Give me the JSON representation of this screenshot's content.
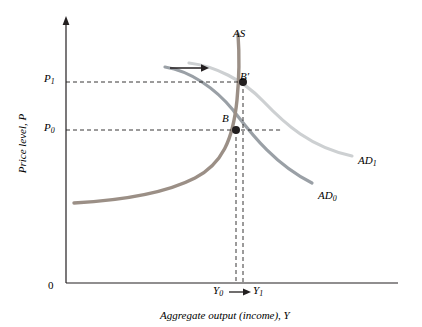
{
  "figure": {
    "axes": {
      "y_label": "Price level, P",
      "x_label": "Aggregate output (income), Y",
      "origin_label": "0"
    },
    "tick_labels": {
      "p1": "P",
      "p1_sub": "1",
      "p0": "P",
      "p0_sub": "0",
      "y0": "Y",
      "y0_sub": "0",
      "y1": "Y",
      "y1_sub": "1"
    },
    "curves": [
      {
        "name": "as-curve",
        "label": "AS",
        "label_sub": "",
        "color": "#231f20",
        "description": "Aggregate supply curve, steep J shape"
      },
      {
        "name": "ad0-curve",
        "label": "AD",
        "label_sub": "0",
        "color": "#9aa0a6",
        "description": "Initial aggregate demand curve, downward sloping"
      },
      {
        "name": "ad1-curve",
        "label": "AD",
        "label_sub": "1",
        "color": "#c9cbcd",
        "description": "Shifted aggregate demand curve, downward sloping"
      }
    ],
    "points": [
      {
        "name": "point-b",
        "label": "B",
        "color": "#231f20"
      },
      {
        "name": "point-b-prime",
        "label": "B",
        "label_prime": "′",
        "color": "#231f20"
      }
    ],
    "annotations": [
      {
        "name": "shift-arrow",
        "description": "rightward arrow showing AD shift"
      },
      {
        "name": "output-shift-arrow",
        "description": "rightward arrow between Y0 and Y1"
      }
    ],
    "colors": {
      "axis": "#231f20",
      "as_curve": "#9b8f86",
      "ad0_curve": "#9aa0a6",
      "ad1_curve": "#cdd0d2",
      "dashed": "#231f20"
    }
  }
}
